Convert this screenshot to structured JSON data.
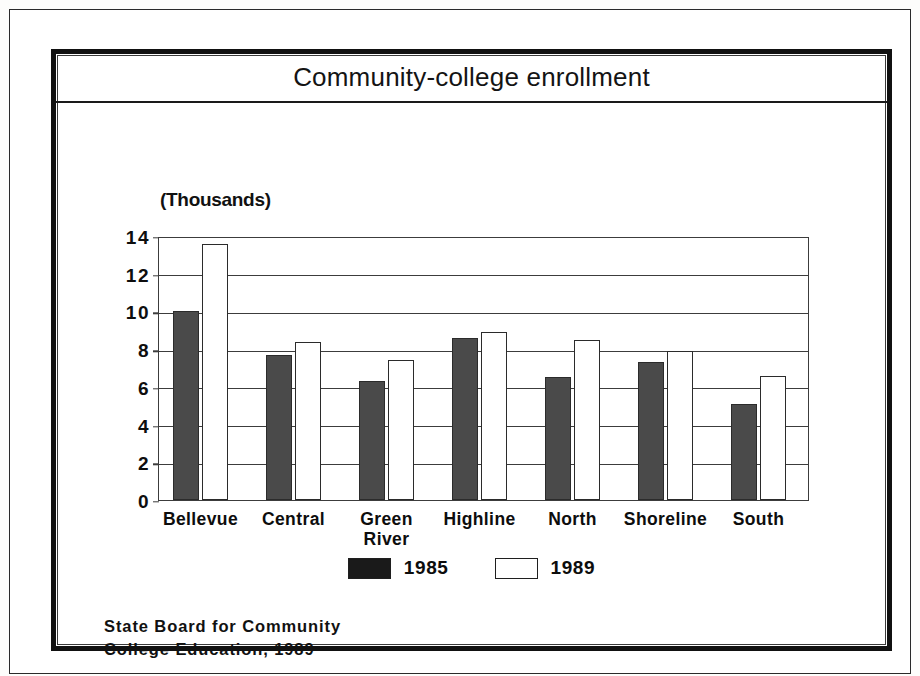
{
  "figure": {
    "title": "Community-college enrollment",
    "units_label": "(Thousands)",
    "source_line1": "State Board for Community",
    "source_line2": "College Education, 1989"
  },
  "legend": {
    "items": [
      {
        "label": "1985",
        "swatch": "filled-black-swatch",
        "color": "#1a1a1a"
      },
      {
        "label": "1989",
        "swatch": "outlined-white-swatch",
        "color": "#ffffff"
      }
    ]
  },
  "axis": {
    "y_ticks": [
      "0",
      "2",
      "4",
      "6",
      "8",
      "10",
      "12",
      "14"
    ]
  },
  "chart_data": {
    "type": "bar",
    "title": "Community-college enrollment",
    "subtitle": "",
    "xlabel": "",
    "ylabel": "(Thousands)",
    "ylim": [
      0,
      14
    ],
    "ytick_values": [
      0,
      2,
      4,
      6,
      8,
      10,
      12,
      14
    ],
    "grid": "horizontal",
    "legend_position": "below-plot-center",
    "categories": [
      "Bellevue",
      "Central",
      "Green River",
      "Highline",
      "North",
      "Shoreline",
      "South"
    ],
    "category_label_lines": [
      [
        "Bellevue"
      ],
      [
        "Central"
      ],
      [
        "Green",
        "River"
      ],
      [
        "Highline"
      ],
      [
        "North"
      ],
      [
        "Shoreline"
      ],
      [
        "South"
      ]
    ],
    "series": [
      {
        "name": "1985",
        "color": "#4a4a4a",
        "values": [
          10.0,
          7.7,
          6.3,
          8.6,
          6.5,
          7.3,
          5.1
        ]
      },
      {
        "name": "1989",
        "color": "#ffffff",
        "values": [
          13.6,
          8.4,
          7.4,
          8.9,
          8.5,
          7.9,
          6.6
        ]
      }
    ],
    "annotations": [
      "State Board for Community College Education, 1989"
    ]
  }
}
